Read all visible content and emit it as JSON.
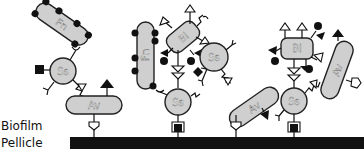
{
  "labels": {
    "biofilm": "Biofilm",
    "pellicle": "Pellicle"
  },
  "cells": {
    "fn": "Fn",
    "ss": "Ss",
    "av": "Av",
    "bl": "Bl"
  },
  "colors": {
    "cell_fill": "#cfcfcf",
    "outline": "#222222",
    "pellicle": "#111111",
    "background": "#ffffff"
  }
}
